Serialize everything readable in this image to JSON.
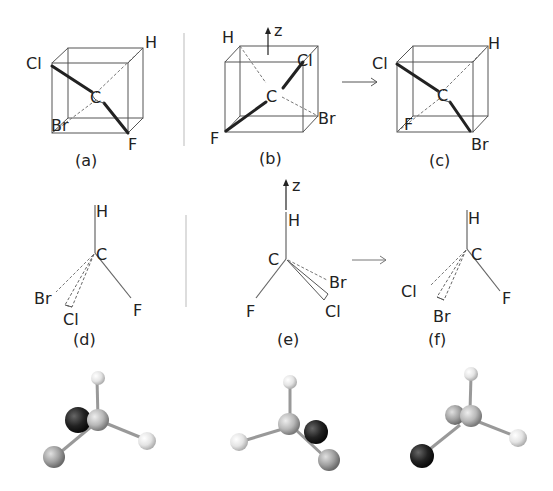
{
  "figure": {
    "colors": {
      "line": "#555555",
      "text": "#222222",
      "ball_dark": "#1a1a1a",
      "ball_mid": "#9a9a9a",
      "ball_light": "#e8e8e8"
    },
    "row1": {
      "panels": [
        {
          "caption": "(a)",
          "atoms": {
            "H": "H",
            "Cl": "Cl",
            "C": "C",
            "Br": "Br",
            "F": "F"
          }
        },
        {
          "caption": "(b)",
          "axis": "z",
          "atoms": {
            "H": "H",
            "Cl": "Cl",
            "C": "C",
            "Br": "Br",
            "F": "F"
          }
        },
        {
          "caption": "(c)",
          "atoms": {
            "H": "H",
            "Cl": "Cl",
            "C": "C",
            "Br": "Br",
            "F": "F"
          }
        }
      ],
      "arrow": "→"
    },
    "row2": {
      "panels": [
        {
          "caption": "(d)",
          "atoms": {
            "H": "H",
            "C": "C",
            "Br": "Br",
            "Cl": "Cl",
            "F": "F"
          }
        },
        {
          "caption": "(e)",
          "axis": "z",
          "atoms": {
            "H": "H",
            "C": "C",
            "Br": "Br",
            "Cl": "Cl",
            "F": "F"
          }
        },
        {
          "caption": "(f)",
          "atoms": {
            "H": "H",
            "C": "C",
            "Cl": "Cl",
            "Br": "Br",
            "F": "F"
          }
        }
      ],
      "arrow": "→"
    },
    "row3": {
      "models": [
        "ball-and-stick model (d)",
        "ball-and-stick model (e)",
        "ball-and-stick model (f)"
      ]
    }
  }
}
